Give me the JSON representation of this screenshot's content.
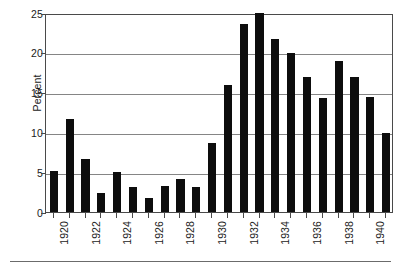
{
  "chart_data": {
    "type": "bar",
    "title": "",
    "subtitle": "",
    "xlabel": "",
    "ylabel": "Percent",
    "ylim": [
      0,
      25
    ],
    "ytick_values": [
      0,
      5,
      10,
      15,
      20,
      25
    ],
    "ytick_labels": [
      "0",
      "5",
      "10",
      "15",
      "20",
      "25"
    ],
    "grid": "horizontal",
    "legend": "none",
    "bar_color": "#0d0d0d",
    "grid_color": "#858585",
    "axis_color": "#4a4a4a",
    "categories": [
      "1920",
      "1921",
      "1922",
      "1923",
      "1924",
      "1925",
      "1926",
      "1927",
      "1928",
      "1929",
      "1930",
      "1931",
      "1932",
      "1933",
      "1934",
      "1935",
      "1936",
      "1937",
      "1938",
      "1939",
      "1940",
      "1941"
    ],
    "xtick_labels": [
      "1920",
      "",
      "1922",
      "",
      "1924",
      "",
      "1926",
      "",
      "1928",
      "",
      "1930",
      "",
      "1932",
      "",
      "1934",
      "",
      "1936",
      "",
      "1938",
      "",
      "1940",
      ""
    ],
    "values": [
      5.2,
      11.7,
      6.7,
      2.4,
      5.0,
      3.2,
      1.8,
      3.3,
      4.2,
      3.1,
      8.7,
      15.9,
      23.6,
      25.0,
      21.7,
      20.0,
      16.9,
      14.3,
      19.0,
      17.0,
      14.5,
      9.9
    ]
  }
}
